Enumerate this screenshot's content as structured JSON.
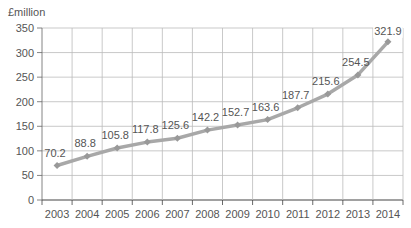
{
  "chart_data": {
    "type": "line",
    "title": "",
    "ylabel": "£million",
    "xlabel": "",
    "categories": [
      "2003",
      "2004",
      "2005",
      "2006",
      "2007",
      "2008",
      "2009",
      "2010",
      "2011",
      "2012",
      "2013",
      "2014"
    ],
    "values": [
      70.2,
      88.8,
      105.8,
      117.8,
      125.6,
      142.2,
      152.7,
      163.6,
      187.7,
      215.6,
      254.5,
      321.9
    ],
    "data_labels": [
      "70.2",
      "88.8",
      "105.8",
      "117.8",
      "125.6",
      "142.2",
      "152.7",
      "163.6",
      "187.7",
      "215.6",
      "254.5",
      "321.9"
    ],
    "yticks": [
      0,
      50,
      100,
      150,
      200,
      250,
      300,
      350
    ],
    "ylim": [
      0,
      350
    ],
    "grid": true,
    "legend": null,
    "line_color": "#a8a8a8",
    "grid_color": "#bbbbbb"
  }
}
